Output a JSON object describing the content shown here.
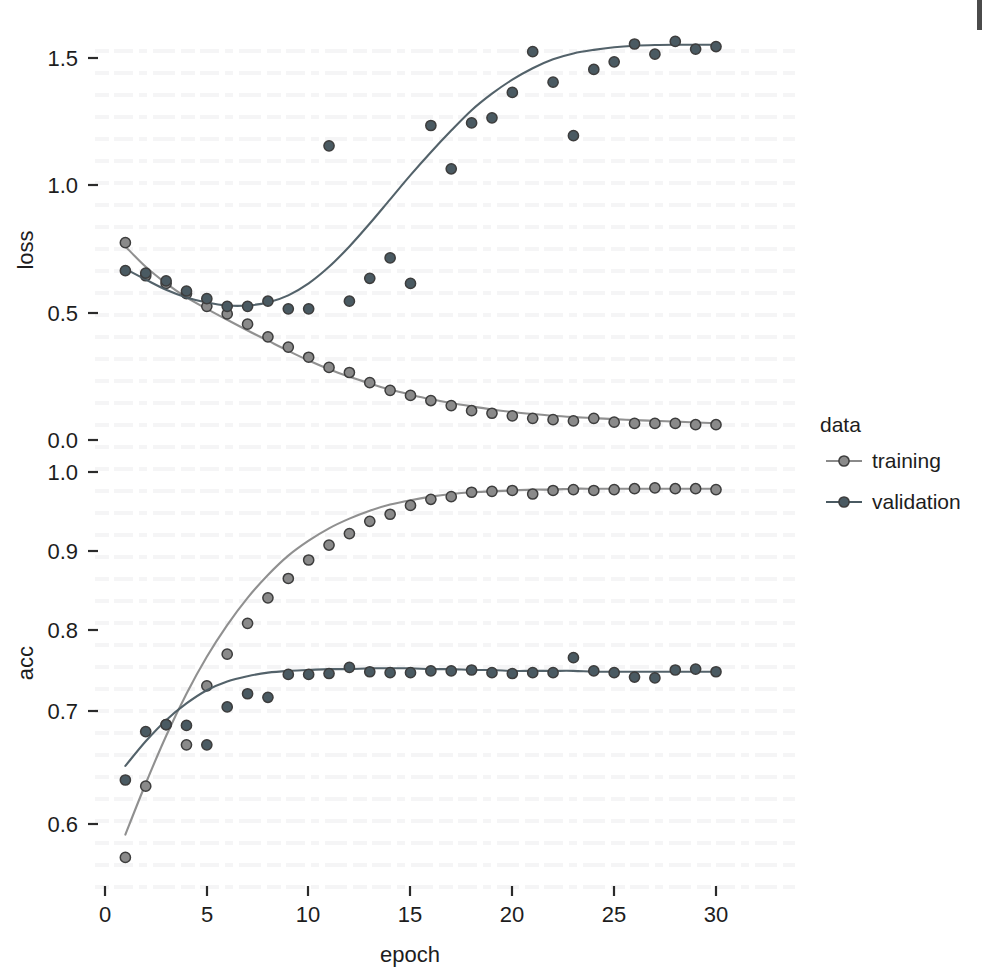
{
  "figure": {
    "kind": "faceted-scatter-with-smooth",
    "panels": [
      "loss",
      "acc"
    ],
    "background": "#ffffff"
  },
  "axes": {
    "x": {
      "label": "epoch",
      "ticks": [
        "0",
        "5",
        "10",
        "15",
        "20",
        "25",
        "30"
      ],
      "tickvalues": [
        0,
        5,
        10,
        15,
        20,
        25,
        30
      ],
      "range": [
        -0.3,
        31.2
      ]
    },
    "y_loss": {
      "label": "loss",
      "ticks": [
        "0.0",
        "0.5",
        "1.0",
        "1.5"
      ],
      "tickvalues": [
        0.0,
        0.5,
        1.0,
        1.5
      ],
      "range": [
        -0.06,
        1.66
      ]
    },
    "y_acc": {
      "label": "acc",
      "ticks": [
        "0.6",
        "0.7",
        "0.8",
        "0.9",
        "1.0"
      ],
      "tickvalues": [
        0.6,
        0.7,
        0.8,
        0.9,
        1.0
      ],
      "range": [
        0.545,
        1.02
      ]
    }
  },
  "legend": {
    "title": "data",
    "position": "right",
    "items": [
      {
        "label": "training",
        "color": "#8a8a8a",
        "key": "point-line-key"
      },
      {
        "label": "validation",
        "color": "#4a5a62",
        "key": "point-line-key"
      }
    ]
  },
  "colors": {
    "training": "#8a8a8a",
    "validation": "#4a5a62",
    "point_stroke": "#3d3d3d",
    "axis_text": "#1d1d1d",
    "tick_mark": "#2b2b2b"
  },
  "chart_data": [
    {
      "type": "scatter",
      "panel": "loss",
      "title": "",
      "xlabel": "epoch",
      "ylabel": "loss",
      "xlim": [
        -0.3,
        31.2
      ],
      "ylim": [
        -0.06,
        1.66
      ],
      "grid": false,
      "legend": "right",
      "x": [
        1,
        2,
        3,
        4,
        5,
        6,
        7,
        8,
        9,
        10,
        11,
        12,
        13,
        14,
        15,
        16,
        17,
        18,
        19,
        20,
        21,
        22,
        23,
        24,
        25,
        26,
        27,
        28,
        29,
        30
      ],
      "series": [
        {
          "name": "training",
          "color": "#8a8a8a",
          "values": [
            0.775,
            0.645,
            0.615,
            0.575,
            0.525,
            0.495,
            0.455,
            0.405,
            0.365,
            0.325,
            0.285,
            0.265,
            0.225,
            0.195,
            0.175,
            0.155,
            0.135,
            0.115,
            0.105,
            0.095,
            0.085,
            0.08,
            0.075,
            0.085,
            0.07,
            0.065,
            0.065,
            0.065,
            0.06,
            0.06
          ],
          "smooth": [
            0.76,
            0.68,
            0.615,
            0.56,
            0.515,
            0.472,
            0.43,
            0.39,
            0.35,
            0.312,
            0.278,
            0.248,
            0.222,
            0.198,
            0.178,
            0.16,
            0.145,
            0.132,
            0.12,
            0.11,
            0.102,
            0.095,
            0.09,
            0.086,
            0.082,
            0.078,
            0.075,
            0.072,
            0.069,
            0.066
          ]
        },
        {
          "name": "validation",
          "color": "#4a5a62",
          "values": [
            0.665,
            0.655,
            0.625,
            0.585,
            0.555,
            0.525,
            0.525,
            0.545,
            0.515,
            0.515,
            1.155,
            0.545,
            0.635,
            0.715,
            0.615,
            1.235,
            1.065,
            1.245,
            1.265,
            1.365,
            1.525,
            1.405,
            1.195,
            1.455,
            1.485,
            1.555,
            1.515,
            1.565,
            1.535,
            1.545
          ],
          "smooth": [
            0.672,
            0.63,
            0.59,
            0.56,
            0.54,
            0.528,
            0.528,
            0.54,
            0.568,
            0.615,
            0.68,
            0.76,
            0.85,
            0.945,
            1.04,
            1.13,
            1.215,
            1.295,
            1.36,
            1.415,
            1.46,
            1.495,
            1.518,
            1.532,
            1.542,
            1.548,
            1.551,
            1.552,
            1.552,
            1.552
          ]
        }
      ]
    },
    {
      "type": "scatter",
      "panel": "acc",
      "title": "",
      "xlabel": "epoch",
      "ylabel": "acc",
      "xlim": [
        -0.3,
        31.2
      ],
      "ylim": [
        0.545,
        1.02
      ],
      "grid": false,
      "legend": "right",
      "x": [
        1,
        2,
        3,
        4,
        5,
        6,
        7,
        8,
        9,
        10,
        11,
        12,
        13,
        14,
        15,
        16,
        17,
        18,
        19,
        20,
        21,
        22,
        23,
        24,
        25,
        26,
        27,
        28,
        29,
        30
      ],
      "series": [
        {
          "name": "training",
          "color": "#8a8a8a",
          "values": [
            0.562,
            0.643,
            0.713,
            0.69,
            0.757,
            0.793,
            0.828,
            0.857,
            0.879,
            0.9,
            0.917,
            0.93,
            0.944,
            0.952,
            0.962,
            0.969,
            0.972,
            0.977,
            0.978,
            0.979,
            0.975,
            0.979,
            0.98,
            0.979,
            0.98,
            0.981,
            0.982,
            0.981,
            0.981,
            0.98
          ],
          "smooth": [
            0.588,
            0.646,
            0.7,
            0.748,
            0.79,
            0.826,
            0.857,
            0.883,
            0.905,
            0.922,
            0.936,
            0.947,
            0.956,
            0.963,
            0.968,
            0.972,
            0.975,
            0.977,
            0.978,
            0.979,
            0.98,
            0.98,
            0.981,
            0.981,
            0.981,
            0.981,
            0.981,
            0.981,
            0.981,
            0.981
          ]
        },
        {
          "name": "validation",
          "color": "#4a5a62",
          "values": [
            0.65,
            0.705,
            0.713,
            0.712,
            0.69,
            0.733,
            0.748,
            0.744,
            0.77,
            0.77,
            0.771,
            0.778,
            0.773,
            0.772,
            0.772,
            0.774,
            0.774,
            0.775,
            0.772,
            0.771,
            0.772,
            0.772,
            0.789,
            0.774,
            0.772,
            0.767,
            0.766,
            0.775,
            0.776,
            0.773
          ]
        }
      ],
      "validation_smooth": [
        0.666,
        0.694,
        0.718,
        0.737,
        0.752,
        0.762,
        0.768,
        0.772,
        0.774,
        0.775,
        0.776,
        0.776,
        0.777,
        0.777,
        0.777,
        0.776,
        0.776,
        0.775,
        0.775,
        0.774,
        0.774,
        0.774,
        0.774,
        0.773,
        0.773,
        0.773,
        0.773,
        0.773,
        0.773,
        0.773
      ]
    }
  ]
}
